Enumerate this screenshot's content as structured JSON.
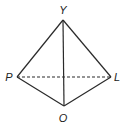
{
  "diagram": {
    "type": "geometry-figure",
    "stroke_color": "#2a2a2a",
    "vertices": [
      {
        "name": "Y",
        "x": 63,
        "y": 20,
        "label_x": 63,
        "label_y": 14
      },
      {
        "name": "P",
        "x": 17,
        "y": 77,
        "label_x": 9,
        "label_y": 81
      },
      {
        "name": "L",
        "x": 111,
        "y": 77,
        "label_x": 117,
        "label_y": 81
      },
      {
        "name": "O",
        "x": 64,
        "y": 106,
        "label_x": 63,
        "label_y": 122
      }
    ],
    "edges": [
      {
        "from": "Y",
        "to": "P",
        "style": "solid"
      },
      {
        "from": "Y",
        "to": "L",
        "style": "solid"
      },
      {
        "from": "P",
        "to": "O",
        "style": "solid"
      },
      {
        "from": "L",
        "to": "O",
        "style": "solid"
      },
      {
        "from": "Y",
        "to": "O",
        "style": "solid"
      },
      {
        "from": "P",
        "to": "L",
        "style": "dashed"
      }
    ],
    "labels": {
      "Y": "Y",
      "P": "P",
      "L": "L",
      "O": "O"
    }
  }
}
